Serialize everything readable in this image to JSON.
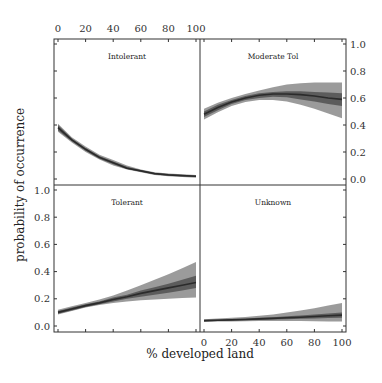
{
  "chart_data": {
    "type": "line",
    "layout": "2x2 facet grid with credible-interval bands",
    "xlabel": "% developed land",
    "ylabel": "probability of occurrence",
    "x_ticks": [
      0,
      20,
      40,
      60,
      80,
      100
    ],
    "y_ticks": [
      0.0,
      0.2,
      0.4,
      0.6,
      0.8,
      1.0
    ],
    "y_tick_labels": [
      "0.0",
      "0.2",
      "0.4",
      "0.6",
      "0.8",
      "1.0"
    ],
    "xlim": [
      0,
      100
    ],
    "ylim": [
      0,
      1
    ],
    "x": [
      0,
      10,
      20,
      30,
      40,
      50,
      60,
      70,
      80,
      90,
      100
    ],
    "panels": [
      {
        "title": "Intolerant",
        "position": "top-left",
        "mean": [
          0.38,
          0.29,
          0.22,
          0.16,
          0.12,
          0.08,
          0.06,
          0.04,
          0.03,
          0.025,
          0.02
        ],
        "inner_lo": [
          0.36,
          0.28,
          0.21,
          0.15,
          0.11,
          0.075,
          0.055,
          0.035,
          0.025,
          0.02,
          0.015
        ],
        "inner_hi": [
          0.4,
          0.3,
          0.23,
          0.17,
          0.13,
          0.09,
          0.065,
          0.045,
          0.035,
          0.03,
          0.025
        ],
        "outer_lo": [
          0.35,
          0.27,
          0.2,
          0.145,
          0.1,
          0.07,
          0.05,
          0.03,
          0.02,
          0.015,
          0.01
        ],
        "outer_hi": [
          0.41,
          0.31,
          0.24,
          0.18,
          0.14,
          0.1,
          0.07,
          0.05,
          0.04,
          0.035,
          0.03
        ]
      },
      {
        "title": "Moderate Tol",
        "position": "top-right",
        "mean": [
          0.48,
          0.53,
          0.57,
          0.6,
          0.62,
          0.63,
          0.63,
          0.625,
          0.615,
          0.6,
          0.59
        ],
        "inner_lo": [
          0.46,
          0.51,
          0.555,
          0.585,
          0.6,
          0.61,
          0.605,
          0.59,
          0.575,
          0.555,
          0.54
        ],
        "inner_hi": [
          0.5,
          0.55,
          0.585,
          0.615,
          0.635,
          0.645,
          0.65,
          0.65,
          0.645,
          0.64,
          0.635
        ],
        "outer_lo": [
          0.44,
          0.495,
          0.54,
          0.57,
          0.585,
          0.585,
          0.575,
          0.55,
          0.52,
          0.485,
          0.45
        ],
        "outer_hi": [
          0.52,
          0.565,
          0.6,
          0.63,
          0.655,
          0.68,
          0.7,
          0.71,
          0.715,
          0.715,
          0.715
        ]
      },
      {
        "title": "Tolerant",
        "position": "bottom-left",
        "mean": [
          0.1,
          0.125,
          0.15,
          0.17,
          0.195,
          0.215,
          0.24,
          0.26,
          0.28,
          0.3,
          0.32
        ],
        "inner_lo": [
          0.09,
          0.115,
          0.14,
          0.16,
          0.18,
          0.2,
          0.215,
          0.23,
          0.245,
          0.26,
          0.28
        ],
        "inner_hi": [
          0.11,
          0.135,
          0.16,
          0.18,
          0.21,
          0.23,
          0.26,
          0.285,
          0.31,
          0.34,
          0.37
        ],
        "outer_lo": [
          0.085,
          0.11,
          0.135,
          0.155,
          0.17,
          0.18,
          0.19,
          0.195,
          0.2,
          0.205,
          0.21
        ],
        "outer_hi": [
          0.12,
          0.145,
          0.17,
          0.195,
          0.225,
          0.26,
          0.3,
          0.34,
          0.38,
          0.425,
          0.47
        ]
      },
      {
        "title": "Unknown",
        "position": "bottom-right",
        "mean": [
          0.04,
          0.042,
          0.045,
          0.048,
          0.052,
          0.056,
          0.06,
          0.065,
          0.07,
          0.075,
          0.08
        ],
        "inner_lo": [
          0.035,
          0.037,
          0.04,
          0.042,
          0.045,
          0.048,
          0.05,
          0.053,
          0.056,
          0.058,
          0.06
        ],
        "inner_hi": [
          0.045,
          0.048,
          0.051,
          0.055,
          0.06,
          0.065,
          0.072,
          0.078,
          0.085,
          0.092,
          0.1
        ],
        "outer_lo": [
          0.03,
          0.032,
          0.034,
          0.035,
          0.036,
          0.037,
          0.037,
          0.036,
          0.035,
          0.034,
          0.033
        ],
        "outer_hi": [
          0.05,
          0.055,
          0.06,
          0.067,
          0.075,
          0.085,
          0.1,
          0.115,
          0.13,
          0.15,
          0.17
        ]
      }
    ],
    "style": {
      "mean_color": "#2b2b2b",
      "inner_band_color": "#555555",
      "outer_band_color": "#8a8a8a",
      "frame_color": "#333333"
    },
    "grid": false,
    "legend": "none"
  }
}
